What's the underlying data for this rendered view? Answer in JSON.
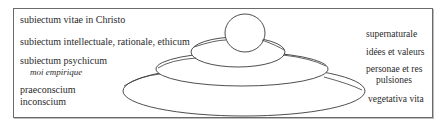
{
  "diagram": {
    "type": "stacked-ellipses",
    "left_labels": [
      {
        "id": "spiritual",
        "lines": [
          "subiectum vitae in Christo"
        ]
      },
      {
        "id": "intellectual",
        "lines": [
          "subiectum intellectuale, rationale, ethicum"
        ]
      },
      {
        "id": "psychic",
        "lines": [
          "subiectum psychicum"
        ],
        "sub": "moi empirique"
      },
      {
        "id": "unconscious",
        "lines": [
          "praeconscium",
          "inconscium"
        ]
      }
    ],
    "right_labels": [
      {
        "id": "supernatural",
        "lines": [
          "supernaturale"
        ]
      },
      {
        "id": "ideas",
        "lines": [
          "idées et valeurs"
        ]
      },
      {
        "id": "persons",
        "lines": [
          "personae et res",
          "pulsiones"
        ]
      },
      {
        "id": "vegetative",
        "lines": [
          "vegetativa vita"
        ]
      }
    ],
    "layers_top_to_bottom": [
      "circle (supernaturale)",
      "small ellipse (idées et valeurs)",
      "medium ellipse (personae et res / pulsiones)",
      "large ellipse (vegetativa vita)"
    ],
    "colors": {
      "stroke": "#3a3a3a",
      "frame": "#6a6a6a",
      "text": "#2a2a2a",
      "background": "#ffffff"
    }
  }
}
